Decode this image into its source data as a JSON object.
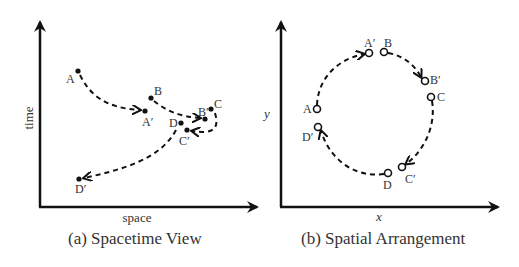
{
  "panels": [
    {
      "id": "a",
      "caption": "(a) Spacetime View",
      "xlabel": "space",
      "ylabel": "time",
      "marker": "filled-dot",
      "points": [
        {
          "label": "A",
          "x": 78,
          "y": 71
        },
        {
          "label": "A′",
          "x": 145,
          "y": 111
        },
        {
          "label": "B",
          "x": 151,
          "y": 98
        },
        {
          "label": "B′",
          "x": 205,
          "y": 119
        },
        {
          "label": "C",
          "x": 211,
          "y": 109
        },
        {
          "label": "C′",
          "x": 187,
          "y": 130
        },
        {
          "label": "D",
          "x": 181,
          "y": 123
        },
        {
          "label": "D′",
          "x": 79,
          "y": 179
        }
      ],
      "transitions": [
        {
          "from": "A",
          "to": "A′"
        },
        {
          "from": "B",
          "to": "B′"
        },
        {
          "from": "C",
          "to": "C′"
        },
        {
          "from": "D",
          "to": "D′"
        }
      ]
    },
    {
      "id": "b",
      "caption": "(b) Spatial Arrangement",
      "xlabel": "x",
      "ylabel": "y",
      "marker": "open-circle",
      "points": [
        {
          "label": "A",
          "x": 317,
          "y": 109
        },
        {
          "label": "A′",
          "x": 369,
          "y": 53
        },
        {
          "label": "B",
          "x": 384,
          "y": 52
        },
        {
          "label": "B′",
          "x": 425,
          "y": 81
        },
        {
          "label": "C",
          "x": 431,
          "y": 97
        },
        {
          "label": "C′",
          "x": 402,
          "y": 167
        },
        {
          "label": "D",
          "x": 388,
          "y": 173
        },
        {
          "label": "D′",
          "x": 318,
          "y": 127
        }
      ],
      "transitions": [
        {
          "from": "A",
          "to": "A′"
        },
        {
          "from": "B",
          "to": "B′"
        },
        {
          "from": "C",
          "to": "C′"
        },
        {
          "from": "D",
          "to": "D′"
        }
      ]
    }
  ],
  "colors": {
    "ink": "#222222",
    "background": "#ffffff"
  }
}
